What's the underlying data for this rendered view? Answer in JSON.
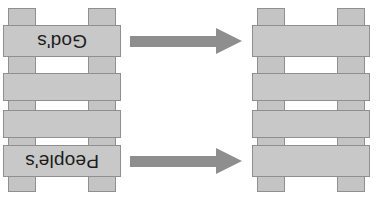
{
  "diagram": {
    "background_color": "#ffffff",
    "rung_fill_color": "#c8c8c8",
    "rung_stroke_color": "#8f8f8f",
    "rail_fill_color": "#c4c4c4",
    "arrow_color": "#8e8e8e",
    "text_color": "#1c1c1c",
    "text_orientation": "rotated-180"
  },
  "left_ladder": {
    "name": "labeled-ladder",
    "rail_count": 2,
    "rung_count": 4,
    "rungs": [
      {
        "index": 1,
        "label": "God's"
      },
      {
        "index": 2,
        "label": ""
      },
      {
        "index": 3,
        "label": ""
      },
      {
        "index": 4,
        "label": "People's"
      }
    ]
  },
  "right_ladder": {
    "name": "blank-ladder",
    "rail_count": 2,
    "rung_count": 4,
    "rungs": [
      {
        "index": 1,
        "label": ""
      },
      {
        "index": 2,
        "label": ""
      },
      {
        "index": 3,
        "label": ""
      },
      {
        "index": 4,
        "label": ""
      }
    ]
  },
  "arrows": [
    {
      "index": 1,
      "direction": "right",
      "label": ""
    },
    {
      "index": 2,
      "direction": "right",
      "label": ""
    }
  ]
}
